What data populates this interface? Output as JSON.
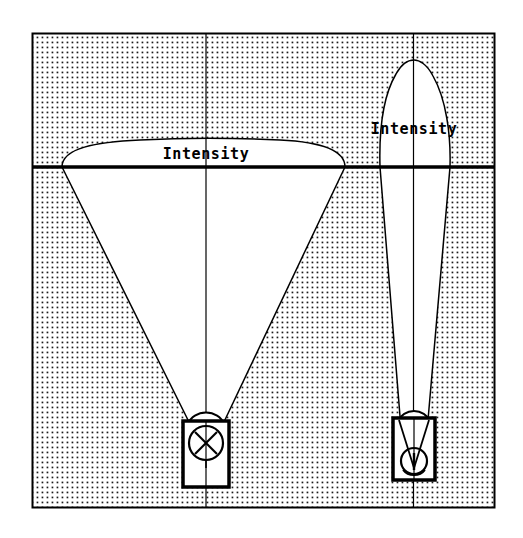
{
  "figure": {
    "background_color": "#ffffff",
    "ink_color": "#000000",
    "stipple_color": "#1a1a1a",
    "frame": {
      "name": "outer-frame",
      "x": 32,
      "y": 33,
      "width": 463,
      "height": 475,
      "stroke_width": 2,
      "fill": "stippled"
    },
    "reference_line": {
      "name": "horizontal-reference-line",
      "y": 167,
      "x_start": 32,
      "x_end": 495,
      "stroke_width": 3.5
    },
    "stipple": {
      "dot_spacing": 5,
      "dot_radius": 0.85
    }
  },
  "distributions": [
    {
      "id": "wide-beam",
      "label": "Intensity",
      "label_x": 206,
      "label_y": 159,
      "axis_x": 206,
      "axis_top": 33,
      "axis_bottom": 508,
      "curve_peak_y": 153,
      "curve_left_x": 62,
      "curve_right_x": 345,
      "beam_type": "wide flood",
      "source_y": 425,
      "luminaire": {
        "name": "luminaire-wide",
        "x": 183,
        "y": 419,
        "width": 46,
        "height": 66,
        "lamp_symbol": "crossed-circle",
        "lamp_center_x": 206,
        "lamp_center_y": 442,
        "lamp_radius": 18
      }
    },
    {
      "id": "narrow-beam",
      "label": "Intensity",
      "label_x": 414,
      "label_y": 134,
      "axis_x": 413,
      "axis_top": 33,
      "axis_bottom": 508,
      "curve_peak_y": 62,
      "curve_left_x": 380,
      "curve_right_x": 450,
      "beam_type": "narrow spot",
      "source_y": 467,
      "luminaire": {
        "name": "luminaire-narrow",
        "x": 393,
        "y": 415,
        "width": 42,
        "height": 62,
        "lamp_symbol": "converging-rays-circle",
        "lamp_center_x": 414,
        "lamp_center_y": 462,
        "lamp_radius": 14
      }
    }
  ]
}
